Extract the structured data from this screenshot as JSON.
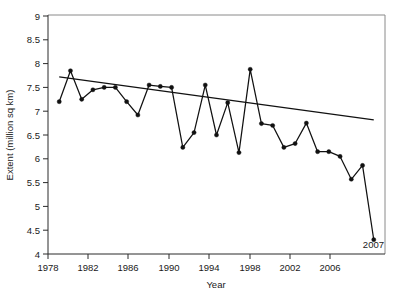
{
  "chart_data": {
    "type": "line",
    "title": "",
    "subtitle": "",
    "xlabel": "Year",
    "ylabel": "Extent (million sq km)",
    "xlim": [
      1978,
      2008
    ],
    "ylim": [
      4,
      9
    ],
    "xticks": [
      1978,
      1982,
      1986,
      1990,
      1994,
      1998,
      2002,
      2006
    ],
    "xticklabels": [
      "1978",
      "1982",
      "1986",
      "1990",
      "1994",
      "1998",
      "2002",
      "2006"
    ],
    "yticks": [
      4,
      4.5,
      5,
      5.5,
      6,
      6.5,
      7,
      7.5,
      8,
      8.5,
      9
    ],
    "yticklabels": [
      "4",
      "4.5",
      "5",
      "5.5",
      "6",
      "6.5",
      "7",
      "7.5",
      "8",
      "8.5",
      "9"
    ],
    "grid": false,
    "legend": false,
    "legend_position": "none",
    "markers": "filled-circle",
    "series": [
      {
        "name": "Arctic sea ice extent",
        "x": [
          1979,
          1980,
          1981,
          1982,
          1983,
          1984,
          1985,
          1986,
          1987,
          1988,
          1989,
          1990,
          1991,
          1992,
          1993,
          1994,
          1995,
          1996,
          1997,
          1998,
          1999,
          2000,
          2001,
          2002,
          2003,
          2004,
          2005,
          2006,
          2007
        ],
        "values": [
          7.2,
          7.85,
          7.25,
          7.45,
          7.5,
          7.5,
          7.2,
          6.92,
          7.55,
          7.52,
          7.5,
          6.24,
          6.55,
          7.55,
          6.5,
          7.18,
          6.13,
          7.88,
          6.74,
          6.7,
          6.24,
          6.32,
          6.75,
          6.15,
          6.15,
          6.05,
          5.57,
          5.86,
          4.3
        ]
      },
      {
        "name": "Linear trend",
        "type": "trend",
        "x": [
          1979,
          2007
        ],
        "values": [
          7.72,
          6.82
        ]
      }
    ],
    "annotations": [
      {
        "text": "2007",
        "x": 2007,
        "y": 4.3,
        "placement": "below-right"
      }
    ]
  },
  "axes": {
    "y_axis_title": "Extent (million sq km)",
    "x_axis_title": "Year"
  }
}
